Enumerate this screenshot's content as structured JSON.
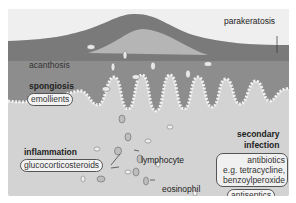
{
  "diagram": {
    "labels": {
      "parakeratosis": "parakeratosis",
      "acanthosis": "acanthosis",
      "spongiosis": "spongiosis",
      "emollients": "emollients",
      "inflammation": "inflammation",
      "glucocorticosteroids": "glucocorticosteroids",
      "lymphocyte": "lymphocyte",
      "eosinophil": "eosinophil",
      "secondary_infection_line1": "secondary",
      "secondary_infection_line2": "infection",
      "antibiotics_line1": "antibiotics",
      "antibiotics_line2": "e.g. tetracycline,",
      "antibiotics_line3": "benzoylperoxide",
      "antiseptics": "antiseptics"
    },
    "colors": {
      "background": "#efefef",
      "stratum_corneum": "#7a7a7a",
      "epidermis": "#8c8c8c",
      "dermis": "#d2d2d2",
      "label_text": "#222222"
    }
  }
}
